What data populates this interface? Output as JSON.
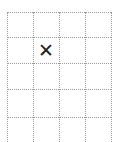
{
  "board": {
    "columns": 4,
    "rows": 5,
    "cells": [
      [
        "",
        "",
        "",
        ""
      ],
      [
        "",
        "✕",
        "",
        ""
      ],
      [
        "",
        "",
        "",
        ""
      ],
      [
        "",
        "",
        "",
        ""
      ],
      [
        "",
        "",
        "",
        ""
      ]
    ]
  },
  "colors": {
    "grid_line": "#9a9a9a",
    "mark": "#222222"
  }
}
